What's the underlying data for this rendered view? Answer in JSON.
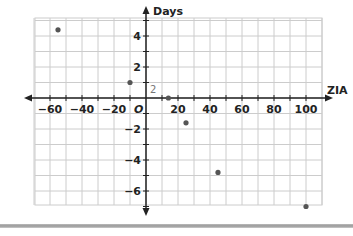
{
  "chart_data": {
    "type": "scatter",
    "title": "",
    "xlabel": "ZIA",
    "ylabel": "Days",
    "xlim": [
      -70,
      110
    ],
    "ylim": [
      -7.5,
      5.5
    ],
    "grid": true,
    "x_ticks": [
      -60,
      -40,
      -20,
      20,
      40,
      60,
      80,
      100
    ],
    "x_tick_labels": [
      "−60",
      "−40",
      "−20",
      "20",
      "40",
      "60",
      "80",
      "100"
    ],
    "y_ticks": [
      4,
      2,
      -2,
      -4,
      -6
    ],
    "y_tick_labels": [
      "4",
      "2",
      "−2",
      "−4",
      "−6"
    ],
    "origin_label": "O",
    "annotation": "2",
    "points": [
      {
        "x": -55,
        "y": 4.4
      },
      {
        "x": -10,
        "y": 1
      },
      {
        "x": 14,
        "y": 0
      },
      {
        "x": 25,
        "y": -1.6
      },
      {
        "x": 45,
        "y": -4.8
      },
      {
        "x": 100,
        "y": -7
      }
    ],
    "point_color": "#555555",
    "grid_color": "#cccccc",
    "axis_color": "#222222"
  }
}
